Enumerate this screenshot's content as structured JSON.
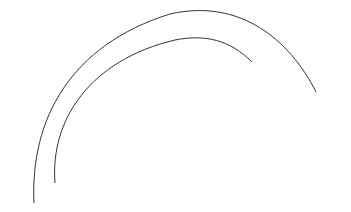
{
  "diagram": {
    "regions": {
      "membrane_label": "CELL MEMBRANE",
      "interior_label": "CELL INTERIOR"
    },
    "transport": {
      "outside_label": "Glucose + Carrier",
      "complex_outer": "G – C",
      "complex_inner": "G – C",
      "dissociated": "C + G"
    },
    "pathway": {
      "entry": "Glucose + ATP",
      "entry_enzyme": "(glucokinase)",
      "steps": [
        {
          "label": "Glycogen"
        },
        {
          "label": "(enzyme)"
        },
        {
          "label": "Uridine diphosphate glucose"
        },
        {
          "label": "(enzyme)"
        },
        {
          "label": "Glucose-1-PO",
          "subscript": "4"
        },
        {
          "label": "(enzyme)"
        },
        {
          "label": "Glucose-6-PO",
          "subscript": "4"
        }
      ]
    },
    "colors": {
      "ink": "#444444",
      "background": "#ffffff"
    }
  }
}
